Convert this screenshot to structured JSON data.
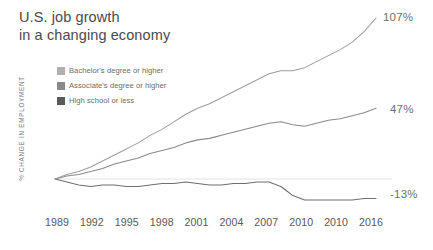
{
  "title": "U.S. job growth\nin a changing economy",
  "axis": {
    "y_label": "% CHANGE IN EMPLOYMENT",
    "x_ticks": [
      "1989",
      "1992",
      "1995",
      "1998",
      "2001",
      "2004",
      "2007",
      "2010",
      "2010",
      "2016"
    ]
  },
  "legend": {
    "items": [
      {
        "label": "Bachelor's degree or higher",
        "color": "#b0b0b0"
      },
      {
        "label": "Associate's degree or higher",
        "color": "#8a8a8a"
      },
      {
        "label": "High school or less",
        "color": "#5a5a5a"
      }
    ]
  },
  "end_labels": [
    {
      "text": "107%",
      "series": "Bachelor's degree or higher"
    },
    {
      "text": "47%",
      "series": "Associate's degree or higher"
    },
    {
      "text": "-13%",
      "series": "High school or less"
    }
  ],
  "colors": {
    "line_light": "#9d9d9d",
    "line_mid": "#8a8a8a",
    "line_dark": "#6f6f6f",
    "zero_line": "#dcdcdc",
    "title": "#4a4a4c",
    "text": "#58595b"
  },
  "chart_data": {
    "type": "line",
    "title": "U.S. job growth in a changing economy",
    "xlabel": "",
    "ylabel": "% CHANGE IN EMPLOYMENT",
    "x_tick_labels": [
      "1989",
      "1992",
      "1995",
      "1998",
      "2001",
      "2004",
      "2007",
      "2010",
      "2010",
      "2016"
    ],
    "x_range": [
      1989,
      2016
    ],
    "ylim": [
      -20,
      110
    ],
    "grid": false,
    "legend_position": "top-left",
    "zero_reference_line": 0,
    "series": [
      {
        "name": "Bachelor's degree or higher",
        "color": "#9d9d9d",
        "end_value": 107,
        "end_label": "107%",
        "x": [
          1989,
          1990,
          1991,
          1992,
          1993,
          1994,
          1995,
          1996,
          1997,
          1998,
          1999,
          2000,
          2001,
          2002,
          2003,
          2004,
          2005,
          2006,
          2007,
          2008,
          2009,
          2010,
          2011,
          2012,
          2013,
          2014,
          2015,
          2016
        ],
        "values": [
          0,
          3,
          5,
          8,
          12,
          16,
          20,
          24,
          29,
          33,
          38,
          43,
          47,
          50,
          54,
          58,
          62,
          66,
          70,
          72,
          72,
          74,
          78,
          82,
          86,
          91,
          98,
          107
        ]
      },
      {
        "name": "Associate's degree or higher",
        "color": "#8a8a8a",
        "end_value": 47,
        "end_label": "47%",
        "x": [
          1989,
          1990,
          1991,
          1992,
          1993,
          1994,
          1995,
          1996,
          1997,
          1998,
          1999,
          2000,
          2001,
          2002,
          2003,
          2004,
          2005,
          2006,
          2007,
          2008,
          2009,
          2010,
          2011,
          2012,
          2013,
          2014,
          2015,
          2016
        ],
        "values": [
          0,
          2,
          3,
          5,
          7,
          10,
          12,
          14,
          17,
          19,
          21,
          24,
          26,
          27,
          29,
          31,
          33,
          35,
          37,
          38,
          36,
          35,
          37,
          39,
          40,
          42,
          44,
          47
        ]
      },
      {
        "name": "High school or less",
        "color": "#6f6f6f",
        "end_value": -13,
        "end_label": "-13%",
        "x": [
          1989,
          1990,
          1991,
          1992,
          1993,
          1994,
          1995,
          1996,
          1997,
          1998,
          1999,
          2000,
          2001,
          2002,
          2003,
          2004,
          2005,
          2006,
          2007,
          2008,
          2009,
          2010,
          2011,
          2012,
          2013,
          2014,
          2015,
          2016
        ],
        "values": [
          0,
          -2,
          -4,
          -5,
          -4,
          -4,
          -5,
          -5,
          -4,
          -3,
          -3,
          -2,
          -3,
          -4,
          -4,
          -3,
          -3,
          -2,
          -2,
          -5,
          -11,
          -14,
          -14,
          -14,
          -14,
          -14,
          -13,
          -13
        ]
      }
    ]
  }
}
